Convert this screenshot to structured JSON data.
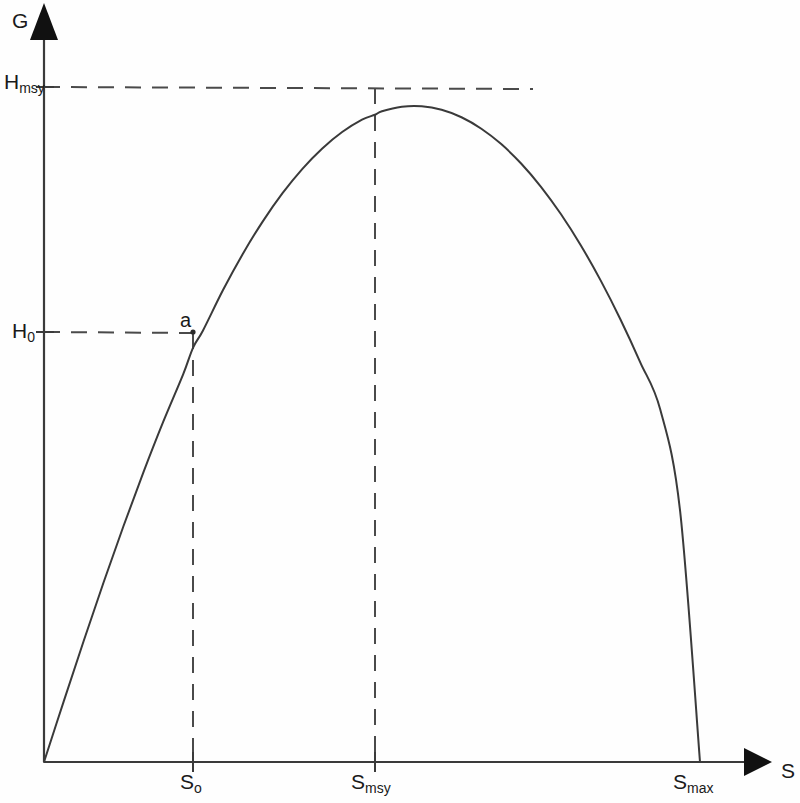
{
  "figure": {
    "title": "",
    "background_color": "#fefefe",
    "line_color": "#3a3a3a"
  },
  "axes": {
    "y_axis_label": "G",
    "x_axis_label": "S",
    "y_axis_arrow": "up-arrow-icon",
    "x_axis_arrow": "right-arrow-icon"
  },
  "labels": {
    "h_msy": "H",
    "h_msy_sub": "msy",
    "h_zero": "H",
    "h_zero_sub": "0",
    "s_zero": "S",
    "s_zero_sub": "o",
    "s_msy": "S",
    "s_msy_sub": "msy",
    "s_max": "S",
    "s_max_sub": "max",
    "point_a": "a"
  },
  "chart_data": {
    "type": "line",
    "title": "",
    "xlabel": "S",
    "ylabel": "G",
    "grid": false,
    "legend": null,
    "xlim": [
      0,
      1
    ],
    "ylim": [
      0,
      1
    ],
    "annotations": [
      {
        "name": "point-a",
        "label": "a",
        "x": 0.2273,
        "y": 0.6369
      },
      {
        "name": "peak-msy",
        "label": "Hmsy",
        "x": 0.5045,
        "y": 1.0
      }
    ],
    "xticks": [
      {
        "label": "So",
        "x": 0.2273
      },
      {
        "label": "Smsy",
        "x": 0.5045
      },
      {
        "label": "Smax",
        "x": 1.0
      }
    ],
    "yticks": [
      {
        "label": "H0",
        "y": 0.6369
      },
      {
        "label": "Hmsy",
        "y": 1.0
      }
    ],
    "guide_lines": [
      {
        "name": "hmsy-horizontal-dashed",
        "orientation": "horizontal",
        "y": 1.0,
        "from_x": 0.0,
        "to_x": 0.74
      },
      {
        "name": "h0-horizontal-dashed",
        "orientation": "horizontal",
        "y": 0.6369,
        "from_x": 0.0,
        "to_x": 0.2273
      },
      {
        "name": "s0-vertical-dashed",
        "orientation": "vertical",
        "x": 0.2273,
        "from_y": 0.0,
        "to_y": 0.6369
      },
      {
        "name": "smsy-vertical-dashed",
        "orientation": "vertical",
        "x": 0.5045,
        "from_y": 0.0,
        "to_y": 1.0
      }
    ],
    "series": [
      {
        "name": "surplus-production-curve",
        "x": [
          0.0,
          0.0303,
          0.0606,
          0.0909,
          0.1212,
          0.1515,
          0.1818,
          0.2121,
          0.2273,
          0.2424,
          0.2727,
          0.303,
          0.3333,
          0.3636,
          0.3939,
          0.4242,
          0.4545,
          0.4848,
          0.5045,
          0.5152,
          0.5455,
          0.5758,
          0.6061,
          0.6364,
          0.6667,
          0.697,
          0.7273,
          0.7576,
          0.7879,
          0.8182,
          0.8485,
          0.8788,
          0.9091,
          0.9394,
          0.9697,
          1.0
        ],
        "y": [
          0.0,
          0.0906,
          0.1797,
          0.2663,
          0.3496,
          0.429,
          0.5041,
          0.5743,
          0.614,
          0.6393,
          0.6988,
          0.7526,
          0.8006,
          0.8427,
          0.8788,
          0.909,
          0.9333,
          0.9517,
          0.9589,
          0.9642,
          0.9708,
          0.9715,
          0.9663,
          0.9552,
          0.9382,
          0.9154,
          0.8867,
          0.8522,
          0.8118,
          0.7656,
          0.7135,
          0.6556,
          0.5918,
          0.5222,
          0.3716,
          0.0
        ]
      }
    ]
  }
}
